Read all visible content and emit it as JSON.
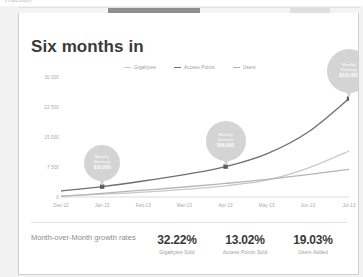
{
  "window": {
    "clipped_top_text": "Traction",
    "scrollbar_name": "horizontal-scrollbar"
  },
  "card": {
    "title": "Six months in"
  },
  "footer": {
    "caption": "Month-over-Month growth rates",
    "stats": [
      {
        "value": "32.22%",
        "label": "Gigabytes Sold"
      },
      {
        "value": "13.02%",
        "label": "Access Points Sold"
      },
      {
        "value": "19.03%",
        "label": "Users Added"
      }
    ]
  },
  "annotations": [
    {
      "line1": "Monthly",
      "line2": "Revenue",
      "amount": "$10,000",
      "x_index": 1
    },
    {
      "line1": "Monthly",
      "line2": "Revenue",
      "amount": "$46,000",
      "x_index": 4
    },
    {
      "line1": "Monthly",
      "line2": "Revenue",
      "amount": "$116,000",
      "x_index": 7
    }
  ],
  "chart_data": {
    "type": "line",
    "title": "Six months in",
    "xlabel": "",
    "ylabel": "",
    "ylim": [
      0,
      30000
    ],
    "yticks": [
      0,
      7500,
      15000,
      22500,
      30000
    ],
    "ytick_labels": [
      "0",
      "7 500",
      "15 000",
      "22 500",
      "30 000"
    ],
    "categories": [
      "Dec-12",
      "Jan-13",
      "Feb-13",
      "Mar-13",
      "Apr-13",
      "May-13",
      "Jun-13",
      "Jul-13"
    ],
    "grid": false,
    "legend_position": "top-center",
    "series": [
      {
        "name": "Gigabytes",
        "color": "#c9c9c9",
        "values": [
          300,
          700,
          1200,
          1900,
          2800,
          4200,
          7200,
          11500
        ]
      },
      {
        "name": "Access Points",
        "color": "#6f6f6f",
        "values": [
          1500,
          2600,
          4000,
          5600,
          7600,
          10800,
          16200,
          24600
        ],
        "markers": [
          1,
          4,
          7
        ]
      },
      {
        "name": "Users",
        "color": "#b5b5b5",
        "values": [
          150,
          900,
          1700,
          2500,
          3400,
          4400,
          5600,
          6900
        ]
      }
    ]
  }
}
